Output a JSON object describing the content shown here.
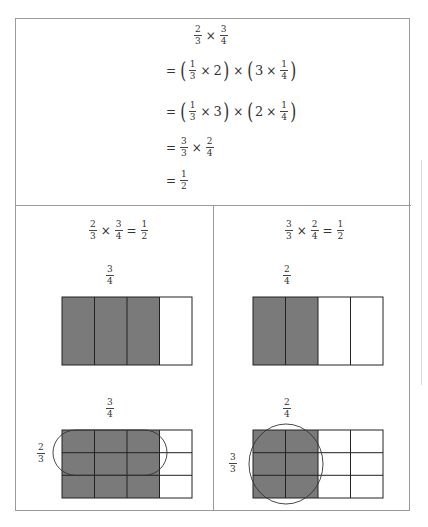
{
  "derivation": {
    "line0": {
      "a_num": "2",
      "a_den": "3",
      "op": "×",
      "b_num": "3",
      "b_den": "4"
    },
    "line1": {
      "eq": "=",
      "p1_num": "1",
      "p1_den": "3",
      "p1_op": "×",
      "p1_int": "2",
      "mid_op": "×",
      "p2_int": "3",
      "p2_op": "×",
      "p2_num": "1",
      "p2_den": "4"
    },
    "line2": {
      "eq": "=",
      "p1_num": "1",
      "p1_den": "3",
      "p1_op": "×",
      "p1_int": "3",
      "mid_op": "×",
      "p2_int": "2",
      "p2_op": "×",
      "p2_num": "1",
      "p2_den": "4"
    },
    "line3": {
      "eq": "=",
      "a_num": "3",
      "a_den": "3",
      "op": "×",
      "b_num": "2",
      "b_den": "4"
    },
    "line4": {
      "eq": "=",
      "a_num": "1",
      "a_den": "2"
    }
  },
  "left_panel": {
    "title": {
      "a_num": "2",
      "a_den": "3",
      "op": "×",
      "b_num": "3",
      "b_den": "4",
      "eq": "=",
      "r_num": "1",
      "r_den": "2"
    },
    "top_label": {
      "num": "3",
      "den": "4"
    },
    "bottom_label": {
      "num": "3",
      "den": "4"
    },
    "side_label": {
      "num": "2",
      "den": "3"
    },
    "top_rect": {
      "columns": 4,
      "shaded_columns": 3
    },
    "bottom_grid": {
      "columns": 4,
      "rows": 3,
      "shaded_columns": 3,
      "circled_rows": 2,
      "circled_columns": 3
    }
  },
  "right_panel": {
    "title": {
      "a_num": "3",
      "a_den": "3",
      "op": "×",
      "b_num": "2",
      "b_den": "4",
      "eq": "=",
      "r_num": "1",
      "r_den": "2"
    },
    "top_label": {
      "num": "2",
      "den": "4"
    },
    "bottom_label": {
      "num": "2",
      "den": "4"
    },
    "side_label": {
      "num": "3",
      "den": "3"
    },
    "top_rect": {
      "columns": 4,
      "shaded_columns": 2
    },
    "bottom_grid": {
      "columns": 4,
      "rows": 3,
      "shaded_columns": 2,
      "circled_rows": 3,
      "circled_columns": 2
    }
  },
  "colors": {
    "shade": "#7a7a7a",
    "grid_line": "#222222",
    "border": "#9a9a9a"
  }
}
